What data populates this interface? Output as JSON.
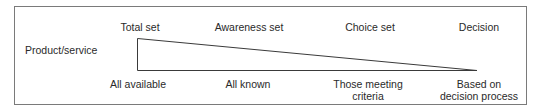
{
  "diagram": {
    "row_label": "Product/service",
    "stages": [
      {
        "header": "Total set",
        "description": "All available"
      },
      {
        "header": "Awareness set",
        "description": "All known"
      },
      {
        "header": "Choice set",
        "description": "Those meeting criteria",
        "description_lines": [
          "Those meeting",
          "criteria"
        ]
      },
      {
        "header": "Decision",
        "description": "Based on decision process",
        "description_lines": [
          "Based on",
          "decision process"
        ]
      }
    ],
    "shape": "narrowing-triangle",
    "colors": {
      "line": "#3a3a3a",
      "frame": "#7a7a7a",
      "text": "#2a2a2a"
    }
  }
}
